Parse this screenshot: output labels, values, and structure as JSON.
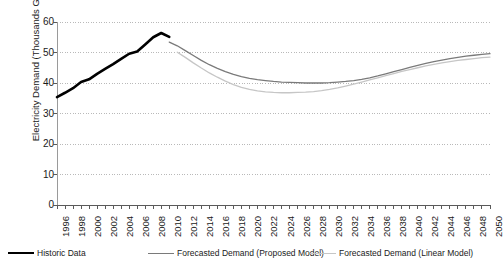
{
  "chart_data": {
    "type": "line",
    "title": "",
    "xlabel": "",
    "ylabel": "Electricity Demand (Thousands GWh)",
    "ylim": [
      0,
      60
    ],
    "ytick_values": [
      0,
      10,
      20,
      30,
      40,
      50,
      60
    ],
    "ytick_labels": [
      "0",
      "10",
      "20",
      "30",
      "40",
      "50",
      "60"
    ],
    "xlim": [
      1996,
      2050
    ],
    "xtick_labels": [
      "1996",
      "1998",
      "2000",
      "2002",
      "2004",
      "2006",
      "2008",
      "2010",
      "2012",
      "2014",
      "2016",
      "2018",
      "2020",
      "2022",
      "2024",
      "2026",
      "2028",
      "2030",
      "2032",
      "2034",
      "2036",
      "2038",
      "2040",
      "2042",
      "2044",
      "2046",
      "2048",
      "2050"
    ],
    "xtick_step": 2,
    "grid": "horizontal-dotted",
    "legend_position": "bottom",
    "series": [
      {
        "name": "Historic Data",
        "color": "#000000",
        "width": 2.6,
        "x": [
          1996,
          1997,
          1998,
          1999,
          2000,
          2001,
          2002,
          2003,
          2004,
          2005,
          2006,
          2007,
          2008,
          2009,
          2010
        ],
        "values": [
          35.4,
          36.8,
          38.3,
          40.3,
          41.2,
          43.0,
          44.6,
          46.2,
          47.9,
          49.6,
          50.3,
          52.6,
          55.0,
          56.4,
          55.1
        ]
      },
      {
        "name": "Forecasted Demand (Proposed Model)",
        "color": "#7a7a7a",
        "width": 1.3,
        "x": [
          2010,
          2011,
          2012,
          2013,
          2014,
          2015,
          2016,
          2017,
          2018,
          2019,
          2020,
          2021,
          2022,
          2023,
          2024,
          2025,
          2026,
          2027,
          2028,
          2029,
          2030,
          2031,
          2032,
          2033,
          2034,
          2035,
          2036,
          2037,
          2038,
          2039,
          2040,
          2041,
          2042,
          2043,
          2044,
          2045,
          2046,
          2047,
          2048,
          2049,
          2050
        ],
        "values": [
          53.4,
          52.2,
          50.6,
          49.0,
          47.4,
          46.0,
          44.8,
          43.7,
          42.8,
          42.1,
          41.5,
          41.1,
          40.8,
          40.5,
          40.3,
          40.2,
          40.1,
          40.0,
          40.0,
          40.0,
          40.1,
          40.3,
          40.5,
          40.8,
          41.2,
          41.7,
          42.3,
          43.0,
          43.7,
          44.4,
          45.1,
          45.8,
          46.4,
          47.0,
          47.5,
          48.0,
          48.4,
          48.8,
          49.1,
          49.4,
          49.6
        ]
      },
      {
        "name": "Forecasted Demand (Linear Model)",
        "color": "#c6c6c6",
        "width": 1.3,
        "x": [
          2011,
          2012,
          2013,
          2014,
          2015,
          2016,
          2017,
          2018,
          2019,
          2020,
          2021,
          2022,
          2023,
          2024,
          2025,
          2026,
          2027,
          2028,
          2029,
          2030,
          2031,
          2032,
          2033,
          2034,
          2035,
          2036,
          2037,
          2038,
          2039,
          2040,
          2041,
          2042,
          2043,
          2044,
          2045,
          2046,
          2047,
          2048,
          2049,
          2050
        ],
        "values": [
          50.1,
          48.4,
          46.6,
          44.9,
          43.3,
          41.9,
          40.6,
          39.5,
          38.6,
          37.9,
          37.4,
          37.1,
          36.9,
          36.8,
          36.8,
          36.9,
          37.0,
          37.2,
          37.5,
          37.9,
          38.4,
          39.0,
          39.6,
          40.3,
          41.0,
          41.7,
          42.4,
          43.1,
          43.8,
          44.4,
          45.0,
          45.6,
          46.1,
          46.6,
          47.0,
          47.4,
          47.7,
          48.0,
          48.3,
          48.5
        ]
      }
    ]
  },
  "legend": {
    "items": [
      {
        "label": "Historic Data",
        "color": "#000000",
        "width": "2.6px"
      },
      {
        "label": "Forecasted Demand (Proposed Model)",
        "color": "#7a7a7a",
        "width": "1.3px"
      },
      {
        "label": "Forecasted Demand (Linear Model)",
        "color": "#c6c6c6",
        "width": "1.3px"
      }
    ]
  },
  "axes": {
    "y_title": "Electricity Demand (Thousands GWh)"
  }
}
